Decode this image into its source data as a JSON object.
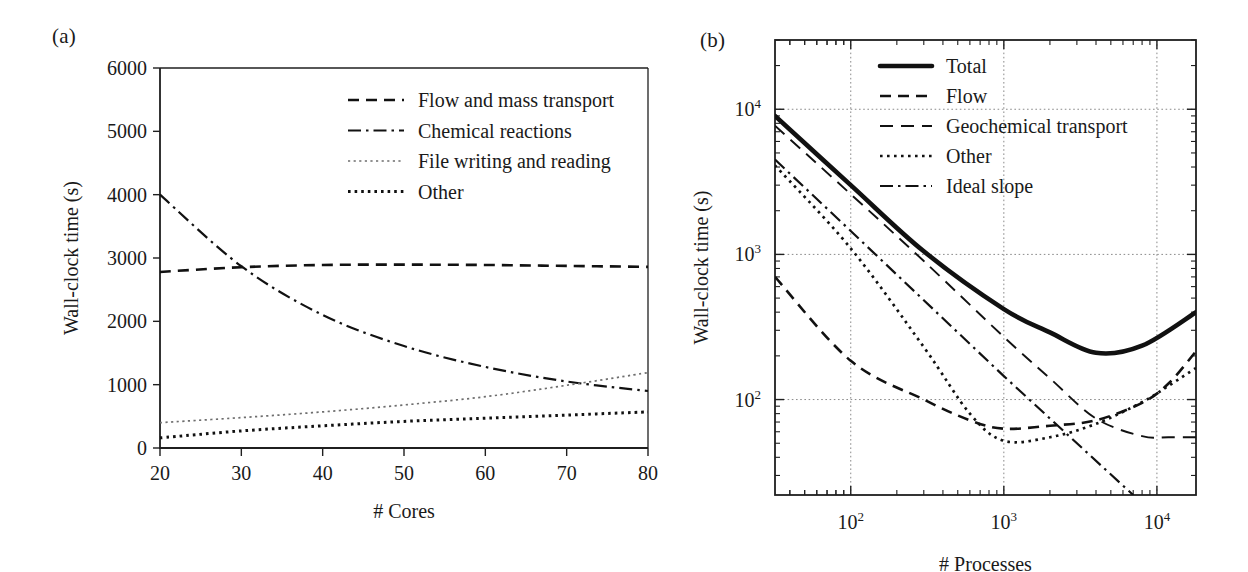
{
  "figure": {
    "panel_a_label": "(a)",
    "panel_b_label": "(b)"
  },
  "chart_data": [
    {
      "id": "panel_a",
      "type": "line",
      "title": "",
      "xlabel": "# Cores",
      "ylabel": "Wall-clock time (s)",
      "xlim": [
        20,
        80
      ],
      "ylim": [
        0,
        6000
      ],
      "xticks": [
        20,
        30,
        40,
        50,
        60,
        70,
        80
      ],
      "yticks": [
        0,
        1000,
        2000,
        3000,
        4000,
        5000,
        6000
      ],
      "xscale": "linear",
      "yscale": "linear",
      "grid": false,
      "legend_position": "upper-right-inside",
      "x": [
        20,
        30,
        40,
        50,
        60,
        70,
        80
      ],
      "series": [
        {
          "name": "Flow and mass transport",
          "style": "dashed",
          "values": [
            2780,
            2855,
            2890,
            2895,
            2890,
            2875,
            2860
          ]
        },
        {
          "name": "Chemical reactions",
          "style": "dash-dot",
          "values": [
            4000,
            2870,
            2100,
            1610,
            1280,
            1050,
            900
          ]
        },
        {
          "name": "File writing and reading",
          "style": "dotted-fine",
          "values": [
            400,
            480,
            570,
            680,
            810,
            990,
            1190
          ]
        },
        {
          "name": "Other",
          "style": "dotted-bold",
          "values": [
            160,
            270,
            350,
            420,
            470,
            520,
            570
          ]
        }
      ]
    },
    {
      "id": "panel_b",
      "type": "line",
      "title": "",
      "xlabel": "# Processes",
      "ylabel": "Wall-clock time (s)",
      "xlim": [
        32,
        18000
      ],
      "ylim": [
        22,
        30000
      ],
      "xscale": "log",
      "yscale": "log",
      "xticks": [
        100,
        1000,
        10000
      ],
      "xtick_labels": [
        "10^2",
        "10^3",
        "10^4"
      ],
      "yticks": [
        100,
        1000,
        10000
      ],
      "ytick_labels": [
        "10^2",
        "10^3",
        "10^4"
      ],
      "grid": true,
      "grid_style": "dotted",
      "legend_position": "upper-right-inside",
      "series": [
        {
          "name": "Total",
          "style": "solid-thick",
          "x": [
            32,
            100,
            300,
            1000,
            2000,
            4000,
            8000,
            18000
          ],
          "values": [
            9000,
            3000,
            1050,
            420,
            290,
            210,
            235,
            400
          ]
        },
        {
          "name": "Flow",
          "style": "dashed",
          "x": [
            32,
            100,
            300,
            600,
            1000,
            2000,
            4000,
            8000,
            12000,
            18000
          ],
          "values": [
            700,
            185,
            100,
            72,
            63,
            66,
            72,
            95,
            130,
            215
          ]
        },
        {
          "name": "Geochemical transport",
          "style": "dashed-thin",
          "x": [
            32,
            100,
            300,
            1000,
            2000,
            4000,
            8000,
            12000,
            18000
          ],
          "values": [
            7700,
            2600,
            900,
            270,
            140,
            74,
            56,
            55,
            55
          ]
        },
        {
          "name": "Other",
          "style": "dotted",
          "x": [
            32,
            100,
            300,
            600,
            1000,
            2000,
            4000,
            8000,
            12000,
            18000
          ],
          "values": [
            4100,
            1100,
            230,
            80,
            52,
            55,
            68,
            96,
            125,
            165
          ]
        },
        {
          "name": "Ideal slope",
          "style": "dash-dot",
          "x": [
            32,
            100,
            1000,
            7000
          ],
          "values": [
            4500,
            1450,
            145,
            22
          ]
        }
      ]
    }
  ],
  "panel_a_legend": [
    {
      "label": "Flow and mass transport",
      "style": "dashed"
    },
    {
      "label": "Chemical reactions",
      "style": "dash-dot"
    },
    {
      "label": "File writing and reading",
      "style": "dotted-fine"
    },
    {
      "label": "Other",
      "style": "dotted-bold"
    }
  ],
  "panel_b_legend": [
    {
      "label": "Total",
      "style": "solid-thick"
    },
    {
      "label": "Flow",
      "style": "dashed"
    },
    {
      "label": "Geochemical transport",
      "style": "dashed-thin"
    },
    {
      "label": "Other",
      "style": "dotted"
    },
    {
      "label": "Ideal slope",
      "style": "dash-dot"
    }
  ]
}
